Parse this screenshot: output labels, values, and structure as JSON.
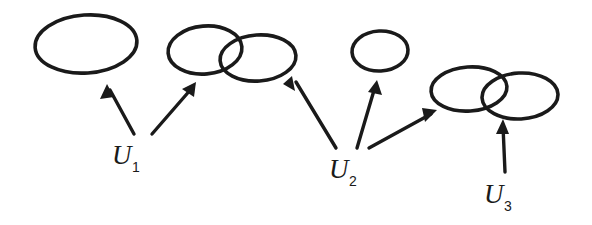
{
  "figure": {
    "kind": "hand-drawn-math-diagram",
    "background_color": "#ffffff",
    "ink_color": "#1a1a1a",
    "width": 592,
    "height": 225
  },
  "labels": [
    {
      "id": "u1",
      "base": "U",
      "subscript": "1",
      "full": "U1",
      "x": 128,
      "y": 164,
      "arrow_count": 2
    },
    {
      "id": "u2",
      "base": "U",
      "subscript": "2",
      "full": "U2",
      "x": 345,
      "y": 178,
      "arrow_count": 3
    },
    {
      "id": "u3",
      "base": "U",
      "subscript": "3",
      "full": "U3",
      "x": 500,
      "y": 203,
      "arrow_count": 1
    }
  ],
  "ellipse_groups": [
    {
      "id": "group-1",
      "label_source": "u1",
      "overlapping": false,
      "ellipses": [
        {
          "id": "e1",
          "cx": 86,
          "cy": 44,
          "rx": 51,
          "ry": 29,
          "rotation": -4
        }
      ]
    },
    {
      "id": "group-2",
      "label_source": "u1",
      "overlapping": true,
      "ellipses": [
        {
          "id": "e2",
          "cx": 205,
          "cy": 50,
          "rx": 37,
          "ry": 24,
          "rotation": -5
        },
        {
          "id": "e3",
          "cx": 258,
          "cy": 58,
          "rx": 38,
          "ry": 23,
          "rotation": -4
        }
      ]
    },
    {
      "id": "group-3",
      "label_source": "u2",
      "overlapping": false,
      "ellipses": [
        {
          "id": "e4",
          "cx": 380,
          "cy": 51,
          "rx": 28,
          "ry": 20,
          "rotation": -3
        }
      ]
    },
    {
      "id": "group-4",
      "label_source": "u2-and-u3",
      "overlapping": true,
      "ellipses": [
        {
          "id": "e5",
          "cx": 469,
          "cy": 89,
          "rx": 38,
          "ry": 22,
          "rotation": -4
        },
        {
          "id": "e6",
          "cx": 520,
          "cy": 96,
          "rx": 38,
          "ry": 23,
          "rotation": -3
        }
      ]
    }
  ],
  "arrows": [
    {
      "id": "arrow-u1-to-group1",
      "from_label": "u1",
      "to_group": "group-1",
      "tail_x": 134,
      "tail_y": 134,
      "tip_x": 107,
      "tip_y": 84,
      "direction": "up-left"
    },
    {
      "id": "arrow-u1-to-group2",
      "from_label": "u1",
      "to_group": "group-2",
      "tail_x": 152,
      "tail_y": 134,
      "tip_x": 196,
      "tip_y": 82,
      "direction": "up-right"
    },
    {
      "id": "arrow-u2-to-group2",
      "from_label": "u2",
      "to_group": "group-2",
      "tail_x": 336,
      "tail_y": 148,
      "tip_x": 292,
      "tip_y": 76,
      "direction": "up-left"
    },
    {
      "id": "arrow-u2-to-group3",
      "from_label": "u2",
      "to_group": "group-3",
      "tail_x": 357,
      "tail_y": 148,
      "tip_x": 377,
      "tip_y": 80,
      "direction": "up"
    },
    {
      "id": "arrow-u2-to-group4",
      "from_label": "u2",
      "to_group": "group-4",
      "tail_x": 369,
      "tail_y": 148,
      "tip_x": 437,
      "tip_y": 110,
      "direction": "up-right"
    },
    {
      "id": "arrow-u3-to-group4",
      "from_label": "u3",
      "to_group": "group-4",
      "tail_x": 505,
      "tail_y": 172,
      "tip_x": 503,
      "tip_y": 119,
      "direction": "up"
    }
  ]
}
